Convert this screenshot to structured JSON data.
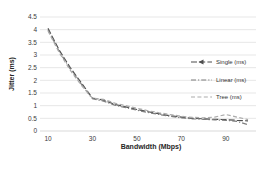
{
  "chart_data": {
    "type": "line",
    "title": "",
    "xlabel": "Bandwidth (Mbps)",
    "ylabel": "Jitter (ms)",
    "x": [
      10,
      15,
      20,
      25,
      30,
      35,
      40,
      45,
      50,
      55,
      60,
      65,
      70,
      75,
      80,
      85,
      90,
      95,
      100
    ],
    "series": [
      {
        "name": "Single (ms)",
        "color": "#4d4d4d",
        "dash": "6 2.2",
        "marker": "triangle",
        "values": [
          4.05,
          3.2,
          2.5,
          1.9,
          1.3,
          1.22,
          1.05,
          0.95,
          0.85,
          0.76,
          0.68,
          0.6,
          0.55,
          0.5,
          0.48,
          0.46,
          0.45,
          0.42,
          0.4
        ]
      },
      {
        "name": "Linear (ms)",
        "color": "#7f7f7f",
        "dash": "5 2 1.2 2",
        "marker": "none",
        "values": [
          4.0,
          3.15,
          2.45,
          1.85,
          1.27,
          1.18,
          1.02,
          0.92,
          0.82,
          0.73,
          0.65,
          0.58,
          0.52,
          0.48,
          0.46,
          0.44,
          0.42,
          0.38,
          0.25
        ]
      },
      {
        "name": "Tree (ms)",
        "color": "#ababab",
        "dash": "4 2.4",
        "marker": "none",
        "values": [
          3.95,
          3.1,
          2.4,
          1.8,
          1.3,
          1.25,
          1.1,
          1.0,
          0.9,
          0.8,
          0.72,
          0.65,
          0.58,
          0.54,
          0.52,
          0.55,
          0.65,
          0.55,
          0.45
        ]
      }
    ],
    "xticks": [
      {
        "value": 10,
        "label": "10"
      },
      {
        "value": 30,
        "label": "30"
      },
      {
        "value": 50,
        "label": "50"
      },
      {
        "value": 70,
        "label": "70"
      },
      {
        "value": 90,
        "label": "90"
      }
    ],
    "yticks": [
      {
        "value": 0,
        "label": "0"
      },
      {
        "value": 0.5,
        "label": "0.5"
      },
      {
        "value": 1,
        "label": "1"
      },
      {
        "value": 1.5,
        "label": "1.5"
      },
      {
        "value": 2,
        "label": "2"
      },
      {
        "value": 2.5,
        "label": "2.5"
      },
      {
        "value": 3,
        "label": "3"
      },
      {
        "value": 3.5,
        "label": "3.5"
      },
      {
        "value": 4,
        "label": "4"
      },
      {
        "value": 4.5,
        "label": "4.5"
      }
    ],
    "xlim": [
      10,
      100
    ],
    "ylim": [
      0,
      4.5
    ],
    "grid": "horizontal",
    "gridline_color": "#dcdcdc",
    "axis_line_color": "#c8c8c8",
    "legend_position": "inside-right",
    "legend_entries": [
      "Single (ms)",
      "Linear (ms)",
      "Tree (ms)"
    ]
  }
}
